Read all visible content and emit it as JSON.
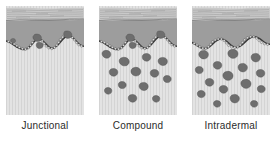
{
  "figure": {
    "panel_count": 3
  },
  "palette": {
    "stratum_corneum": "#c9c9c9",
    "stratum_corneum_lines": "#8a8a8a",
    "epidermis": "#9d9d9d",
    "epidermis_edge": "#6f6f6f",
    "basal_layer_outline": "#3a3a3a",
    "basal_cell_fill": "#d8d8d8",
    "dermis": "#e2e2e2",
    "dermis_striation": "#d2d2d2",
    "nest_fill": "#6e6e6e",
    "nest_edge": "#4a4a4a",
    "caption_text": "#2b2b2b",
    "background": "#ffffff"
  },
  "panels": [
    {
      "id": "junctional",
      "caption": "Junctional",
      "description": "Nevus cell nests confined to the dermo-epidermal junction",
      "junction_nests": 3,
      "dermal_nests": 0,
      "nest_locations": "junction-only"
    },
    {
      "id": "compound",
      "caption": "Compound",
      "description": "Nevus cell nests at the dermo-epidermal junction and within the dermis",
      "junction_nests": 3,
      "dermal_nests": 13,
      "nest_locations": "junction-and-dermis"
    },
    {
      "id": "intradermal",
      "caption": "Intradermal",
      "description": "Nevus cell nests confined to the dermis",
      "junction_nests": 0,
      "dermal_nests": 15,
      "nest_locations": "dermis-only"
    }
  ],
  "layers": [
    {
      "name": "Stratum corneum",
      "order": 1
    },
    {
      "name": "Epidermis",
      "order": 2
    },
    {
      "name": "Dermo-epidermal junction",
      "order": 3
    },
    {
      "name": "Dermis",
      "order": 4
    }
  ]
}
